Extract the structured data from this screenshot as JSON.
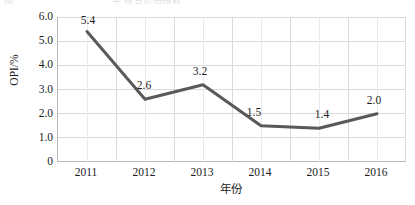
{
  "caption_remnant": {
    "left_fragment": "图",
    "right_fragment": "年 综合价格指数"
  },
  "chart_data": {
    "type": "line",
    "title": "",
    "subtitle": "",
    "xlabel": "年份",
    "ylabel": "OPI/%",
    "categories": [
      "2011",
      "2012",
      "2013",
      "2014",
      "2015",
      "2016"
    ],
    "values": [
      5.4,
      2.6,
      3.2,
      1.5,
      1.4,
      2.0
    ],
    "data_labels": [
      "5.4",
      "2.6",
      "3.2",
      "1.5",
      "1.4",
      "2.0"
    ],
    "series": [
      {
        "name": "OPI",
        "values": [
          5.4,
          2.6,
          3.2,
          1.5,
          1.4,
          2.0
        ],
        "color": "#595959"
      }
    ],
    "ylim": [
      0,
      6.0
    ],
    "ytick_values": [
      0,
      1.0,
      2.0,
      3.0,
      4.0,
      5.0,
      6.0
    ],
    "ytick_labels": [
      "0",
      "1.0",
      "2.0",
      "3.0",
      "4.0",
      "5.0",
      "6.0"
    ],
    "xtick_labels": [
      "2011",
      "2012",
      "2013",
      "2014",
      "2015",
      "2016"
    ],
    "grid": {
      "horizontal": true,
      "vertical": true,
      "color": "#d9dadc"
    },
    "legend": {
      "visible": false,
      "position": "none"
    },
    "line_style": {
      "color": "#595959",
      "width": 3,
      "markers": false
    },
    "axis_color": "#b6b8bb",
    "background": "#ffffff"
  }
}
